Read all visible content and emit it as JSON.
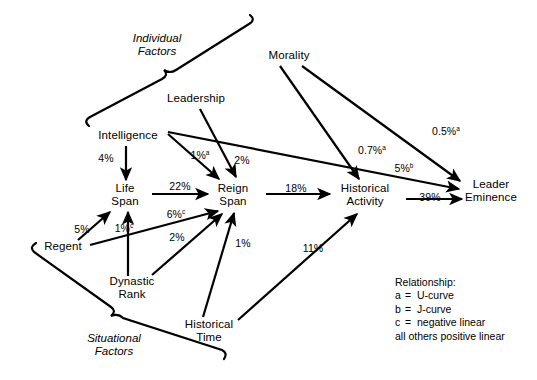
{
  "diagram": {
    "background_color": "#ffffff",
    "line_color": "#000000",
    "nodes": [
      {
        "id": "morality",
        "label_line1": "Morality",
        "label_line2": "",
        "x": 289,
        "y": 55
      },
      {
        "id": "leadership",
        "label_line1": "Leadership",
        "label_line2": "",
        "x": 196,
        "y": 98
      },
      {
        "id": "intelligence",
        "label_line1": "Intelligence",
        "label_line2": "",
        "x": 128,
        "y": 135
      },
      {
        "id": "life-span",
        "label_line1": "Life",
        "label_line2": "Span",
        "x": 125,
        "y": 194
      },
      {
        "id": "reign-span",
        "label_line1": "Reign",
        "label_line2": "Span",
        "x": 233,
        "y": 194
      },
      {
        "id": "historical-activity",
        "label_line1": "Historical",
        "label_line2": "Activity",
        "x": 365,
        "y": 194
      },
      {
        "id": "leader-eminence",
        "label_line1": "Leader",
        "label_line2": "Eminence",
        "x": 491,
        "y": 190
      },
      {
        "id": "regent",
        "label_line1": "Regent",
        "label_line2": "",
        "x": 63,
        "y": 246
      },
      {
        "id": "dynastic-rank",
        "label_line1": "Dynastic",
        "label_line2": "Rank",
        "x": 132,
        "y": 287
      },
      {
        "id": "historical-time",
        "label_line1": "Historical",
        "label_line2": "Time",
        "x": 209,
        "y": 330
      }
    ],
    "group_labels": [
      {
        "id": "individual-factors",
        "line1": "Individual",
        "line2": "Factors",
        "x": 157,
        "y": 44
      },
      {
        "id": "situational-factors",
        "line1": "Situational",
        "line2": "Factors",
        "x": 114,
        "y": 344
      }
    ],
    "edges": [
      {
        "id": "intelligence-to-life-span",
        "from": "intelligence",
        "to": "life-span",
        "value": "4%",
        "note": "",
        "lx": 106,
        "ly": 158
      },
      {
        "id": "intelligence-to-reign-span",
        "from": "intelligence",
        "to": "reign-span",
        "value": "1%",
        "note": "a",
        "lx": 200,
        "ly": 155
      },
      {
        "id": "intelligence-to-leader-eminence",
        "from": "intelligence",
        "to": "leader-eminence",
        "value": "5%",
        "note": "b",
        "lx": 404,
        "ly": 168
      },
      {
        "id": "leadership-to-reign-span",
        "from": "leadership",
        "to": "reign-span",
        "value": "2%",
        "note": "",
        "lx": 242,
        "ly": 160
      },
      {
        "id": "morality-to-historical-activity",
        "from": "morality",
        "to": "historical-activity",
        "value": "0.7%",
        "note": "a",
        "lx": 372,
        "ly": 150
      },
      {
        "id": "morality-to-leader-eminence",
        "from": "morality",
        "to": "leader-eminence",
        "value": "0.5%",
        "note": "a",
        "lx": 446,
        "ly": 131
      },
      {
        "id": "life-span-to-reign-span",
        "from": "life-span",
        "to": "reign-span",
        "value": "22%",
        "note": "",
        "lx": 180,
        "ly": 186
      },
      {
        "id": "reign-span-to-historical-activity",
        "from": "reign-span",
        "to": "historical-activity",
        "value": "18%",
        "note": "",
        "lx": 296,
        "ly": 188
      },
      {
        "id": "historical-activity-to-leader-eminence",
        "from": "historical-activity",
        "to": "leader-eminence",
        "value": "39%",
        "note": "",
        "lx": 430,
        "ly": 197
      },
      {
        "id": "regent-to-life-span",
        "from": "regent",
        "to": "life-span",
        "value": "5%",
        "note": "",
        "lx": 82,
        "ly": 229
      },
      {
        "id": "regent-to-reign-span",
        "from": "regent",
        "to": "reign-span",
        "value": "6%",
        "note": "c",
        "lx": 176,
        "ly": 214
      },
      {
        "id": "dynastic-rank-to-life-span",
        "from": "dynastic-rank",
        "to": "life-span",
        "value": "1%",
        "note": "c",
        "lx": 124,
        "ly": 228
      },
      {
        "id": "dynastic-rank-to-reign-span",
        "from": "dynastic-rank",
        "to": "reign-span",
        "value": "2%",
        "note": "",
        "lx": 177,
        "ly": 237
      },
      {
        "id": "historical-time-to-reign-span",
        "from": "historical-time",
        "to": "reign-span",
        "value": "1%",
        "note": "",
        "lx": 243,
        "ly": 243
      },
      {
        "id": "historical-time-to-historical-activity",
        "from": "historical-time",
        "to": "historical-activity",
        "value": "11%",
        "note": "",
        "lx": 313,
        "ly": 248
      }
    ],
    "legend": {
      "title": "Relationship:",
      "items": [
        {
          "key": "a",
          "eq": "=",
          "text": "U-curve"
        },
        {
          "key": "b",
          "eq": "=",
          "text": "J-curve"
        },
        {
          "key": "c",
          "eq": "=",
          "text": "negative linear"
        }
      ],
      "footer": "all others positive linear"
    }
  }
}
